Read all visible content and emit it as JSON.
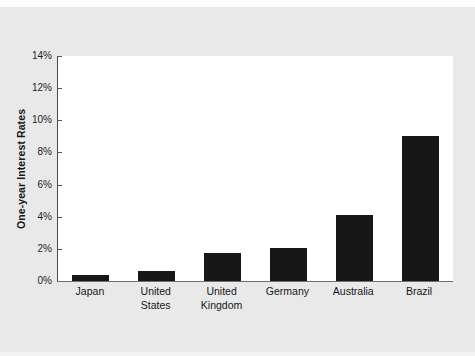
{
  "chart_data": {
    "type": "bar",
    "title": "",
    "xlabel": "",
    "ylabel": "One-year Interest Rates",
    "categories": [
      "Japan",
      "United States",
      "United Kingdom",
      "Germany",
      "Australia",
      "Brazil"
    ],
    "category_lines": [
      [
        "Japan"
      ],
      [
        "United",
        "States"
      ],
      [
        "United",
        "Kingdom"
      ],
      [
        "Germany"
      ],
      [
        "Australia"
      ],
      [
        "Brazil"
      ]
    ],
    "values": [
      0.4,
      0.65,
      1.75,
      2.05,
      4.1,
      9.05
    ],
    "value_labels": [
      "0.4%",
      "0.65%",
      "1.75%",
      "2.05%",
      "4.1%",
      "9.05%"
    ],
    "ylim": [
      0,
      14
    ],
    "ytick_values": [
      0,
      2,
      4,
      6,
      8,
      10,
      12,
      14
    ],
    "ytick_labels": [
      "0%",
      "2%",
      "4%",
      "6%",
      "8%",
      "10%",
      "12%",
      "14%"
    ],
    "grid": false,
    "legend": false,
    "bar_color": "#171717",
    "plot_background": "#ffffff",
    "figure_background": "#e9e9e9",
    "axis_color": "#4a4a4a"
  }
}
